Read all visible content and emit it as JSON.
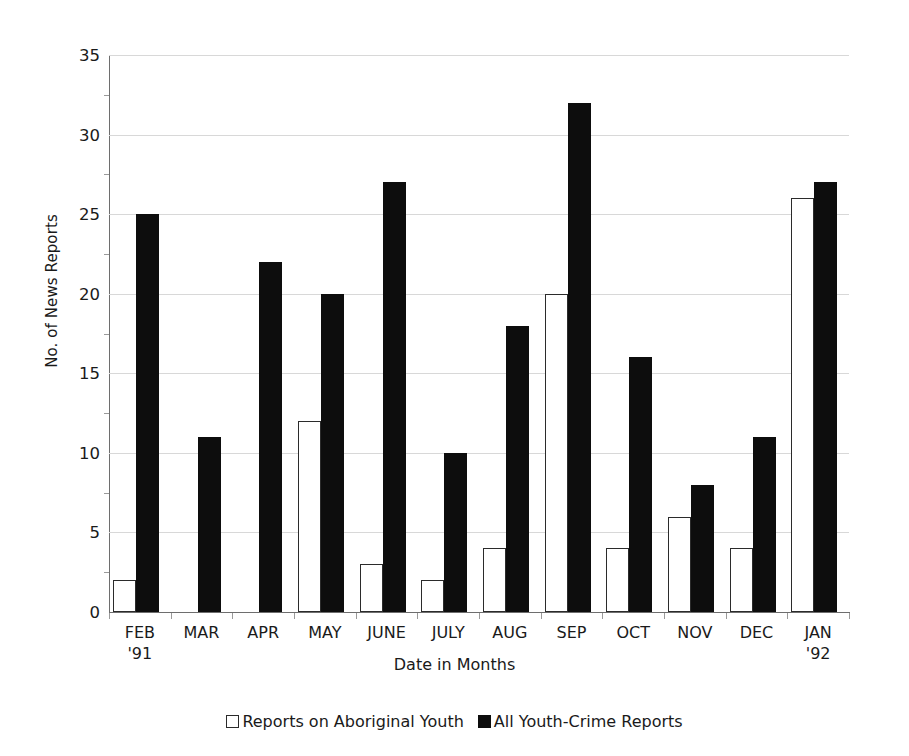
{
  "chart_data": {
    "type": "bar",
    "title": "",
    "xlabel": "Date in Months",
    "ylabel": "No. of News Reports",
    "ylim": [
      0,
      35
    ],
    "ytick_step": 5,
    "yticks": [
      0,
      5,
      10,
      15,
      20,
      25,
      30,
      35
    ],
    "grid": true,
    "legend_position": "bottom-center",
    "categories": [
      "FEB '91",
      "MAR",
      "APR",
      "MAY",
      "JUNE",
      "JULY",
      "AUG",
      "SEP",
      "OCT",
      "NOV",
      "DEC",
      "JAN '92"
    ],
    "category_lines": [
      [
        "FEB",
        "'91"
      ],
      [
        "MAR",
        ""
      ],
      [
        "APR",
        ""
      ],
      [
        "MAY",
        ""
      ],
      [
        "JUNE",
        ""
      ],
      [
        "JULY",
        ""
      ],
      [
        "AUG",
        ""
      ],
      [
        "SEP",
        ""
      ],
      [
        "OCT",
        ""
      ],
      [
        "NOV",
        ""
      ],
      [
        "DEC",
        ""
      ],
      [
        "JAN",
        "'92"
      ]
    ],
    "series": [
      {
        "name": "Reports on Aboriginal Youth",
        "style": "open",
        "color": "#ffffff",
        "edge_color": "#2b2b2b",
        "values": [
          2,
          0,
          0,
          12,
          3,
          2,
          4,
          20,
          4,
          6,
          4,
          26
        ]
      },
      {
        "name": "All Youth-Crime Reports",
        "style": "filled",
        "color": "#0d0d0d",
        "edge_color": "#0d0d0d",
        "values": [
          25,
          11,
          22,
          20,
          27,
          10,
          18,
          32,
          16,
          8,
          11,
          27
        ]
      }
    ]
  },
  "legend": {
    "entries": [
      {
        "label": "Reports on Aboriginal Youth",
        "swatch": "open-square-icon"
      },
      {
        "label": "All Youth-Crime Reports",
        "swatch": "filled-square-icon"
      }
    ]
  }
}
